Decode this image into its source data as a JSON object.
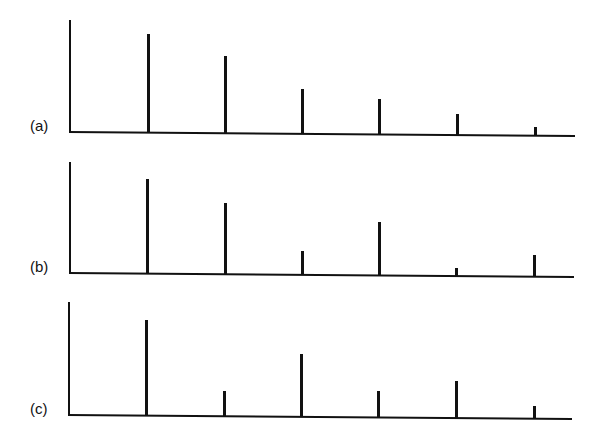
{
  "chart_data": [
    {
      "type": "bar",
      "title": "",
      "panel_label": "(a)",
      "xlabel": "",
      "ylabel": "",
      "categories": [
        "1",
        "2",
        "3",
        "4",
        "5",
        "6"
      ],
      "values": [
        98,
        76,
        44,
        34,
        20,
        8
      ],
      "ylim": [
        0,
        112
      ],
      "grid": false,
      "legend": null
    },
    {
      "type": "bar",
      "title": "",
      "panel_label": "(b)",
      "xlabel": "",
      "ylabel": "",
      "categories": [
        "1",
        "2",
        "3",
        "4",
        "5",
        "6"
      ],
      "values": [
        94,
        70,
        23,
        52,
        7,
        21
      ],
      "ylim": [
        0,
        112
      ],
      "grid": false,
      "legend": null
    },
    {
      "type": "bar",
      "title": "",
      "panel_label": "(c)",
      "xlabel": "",
      "ylabel": "",
      "categories": [
        "1",
        "2",
        "3",
        "4",
        "5",
        "6"
      ],
      "values": [
        95,
        24,
        62,
        25,
        36,
        12
      ],
      "ylim": [
        0,
        112
      ],
      "grid": false,
      "legend": null
    }
  ],
  "panels": [
    {
      "label": "(a)"
    },
    {
      "label": "(b)"
    },
    {
      "label": "(c)"
    }
  ]
}
